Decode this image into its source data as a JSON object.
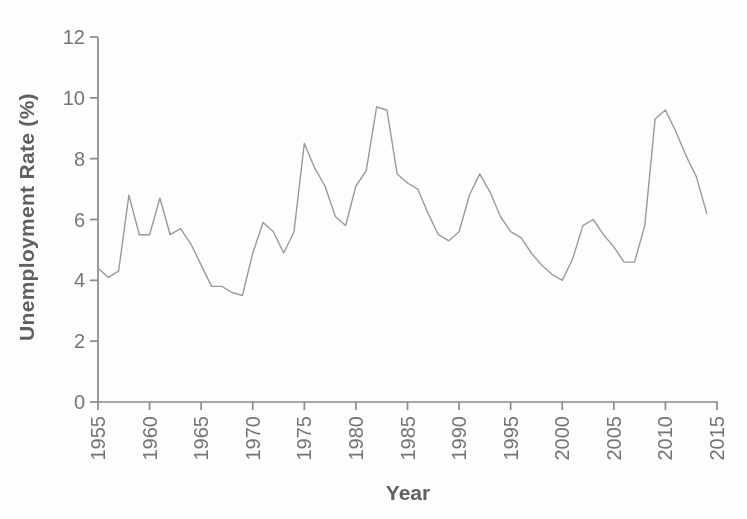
{
  "figure": {
    "width": 747,
    "height": 519,
    "background_color": "#fdfdfc"
  },
  "chart_data": {
    "type": "line",
    "title": "",
    "xlabel": "Year",
    "ylabel": "Unemployment Rate (%)",
    "xlim": [
      1955,
      2015
    ],
    "ylim": [
      0,
      12
    ],
    "x_ticks": [
      1955,
      1960,
      1965,
      1970,
      1975,
      1980,
      1985,
      1990,
      1995,
      2000,
      2005,
      2010,
      2015
    ],
    "y_ticks": [
      0,
      2,
      4,
      6,
      8,
      10,
      12
    ],
    "grid": false,
    "legend": null,
    "style": {
      "line_color": "#9a9a9a",
      "line_width": 1.4,
      "axis_color": "#8a8a8a",
      "axis_width": 1.7,
      "tick_length": 8,
      "tick_label_color": "#747474",
      "axis_title_color": "#5f5f5f"
    },
    "series": [
      {
        "name": "Unemployment Rate (%)",
        "x": [
          1955,
          1956,
          1957,
          1958,
          1959,
          1960,
          1961,
          1962,
          1963,
          1964,
          1965,
          1966,
          1967,
          1968,
          1969,
          1970,
          1971,
          1972,
          1973,
          1974,
          1975,
          1976,
          1977,
          1978,
          1979,
          1980,
          1981,
          1982,
          1983,
          1984,
          1985,
          1986,
          1987,
          1988,
          1989,
          1990,
          1991,
          1992,
          1993,
          1994,
          1995,
          1996,
          1997,
          1998,
          1999,
          2000,
          2001,
          2002,
          2003,
          2004,
          2005,
          2006,
          2007,
          2008,
          2009,
          2010,
          2011,
          2012,
          2013,
          2014
        ],
        "y": [
          4.4,
          4.1,
          4.3,
          6.8,
          5.5,
          5.5,
          6.7,
          5.5,
          5.7,
          5.2,
          4.5,
          3.8,
          3.8,
          3.6,
          3.5,
          4.9,
          5.9,
          5.6,
          4.9,
          5.6,
          8.5,
          7.7,
          7.1,
          6.1,
          5.8,
          7.1,
          7.6,
          9.7,
          9.6,
          7.5,
          7.2,
          7.0,
          6.2,
          5.5,
          5.3,
          5.6,
          6.8,
          7.5,
          6.9,
          6.1,
          5.6,
          5.4,
          4.9,
          4.5,
          4.2,
          4.0,
          4.7,
          5.8,
          6.0,
          5.5,
          5.1,
          4.6,
          4.6,
          5.8,
          9.3,
          9.6,
          8.9,
          8.1,
          7.4,
          6.2
        ]
      }
    ]
  }
}
